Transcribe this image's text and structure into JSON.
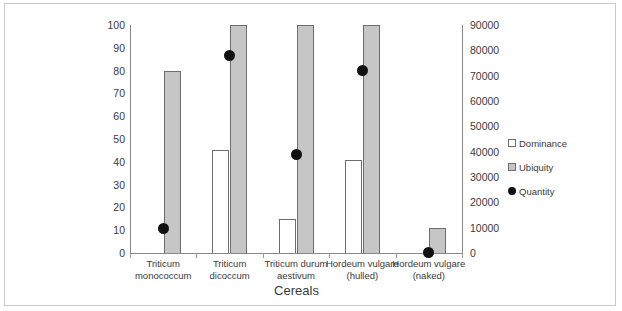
{
  "chart_data": {
    "type": "bar",
    "title": "",
    "xlabel": "Cereals",
    "ylabel": "",
    "categories": [
      "Triticum monococcum",
      "Triticum dicoccum",
      "Triticum durum aestivum",
      "Hordeum vulgare (hulled)",
      "Hordeum vulgare (naked)"
    ],
    "category_lines": [
      [
        "Triticum",
        "monococcum"
      ],
      [
        "Triticum",
        "dicoccum"
      ],
      [
        "Triticum durum",
        "aestivum"
      ],
      [
        "Hordeum vulgare",
        "(hulled)"
      ],
      [
        "Hordeum vulgare",
        "(naked)"
      ]
    ],
    "series": [
      {
        "name": "Dominance",
        "axis": "left",
        "chart": "bar",
        "color": "#ffffff",
        "values": [
          0,
          45,
          15,
          41,
          0
        ]
      },
      {
        "name": "Ubiquity",
        "axis": "left",
        "chart": "bar",
        "color": "#c6c6c6",
        "values": [
          80,
          100,
          100,
          100,
          11
        ]
      },
      {
        "name": "Quantity",
        "axis": "right",
        "chart": "scatter",
        "color": "#111111",
        "values": [
          9500,
          78000,
          39000,
          72000,
          300
        ]
      }
    ],
    "left_axis": {
      "min": 0,
      "max": 100,
      "step": 10,
      "ticks": [
        "0",
        "10",
        "20",
        "30",
        "40",
        "50",
        "60",
        "70",
        "80",
        "90",
        "100"
      ]
    },
    "right_axis": {
      "min": 0,
      "max": 90000,
      "step": 10000,
      "ticks": [
        "0",
        "10000",
        "20000",
        "30000",
        "40000",
        "50000",
        "60000",
        "70000",
        "80000",
        "90000"
      ]
    },
    "legend": {
      "position": "right",
      "entries": [
        {
          "label": "Dominance",
          "marker": "open-square",
          "color": "#ffffff"
        },
        {
          "label": "Ubiquity",
          "marker": "filled-square",
          "color": "#c6c6c6"
        },
        {
          "label": "Quantity",
          "marker": "filled-circle",
          "color": "#111111"
        }
      ]
    },
    "grid": false
  }
}
